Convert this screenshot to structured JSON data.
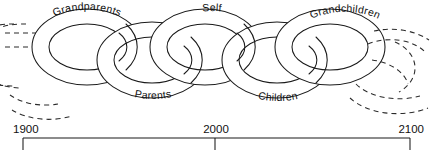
{
  "figure": {
    "type": "diagram",
    "stroke_color": "#1a1a1a",
    "background_color": "#ffffff",
    "dashed_color": "#2b2b2b"
  },
  "chain": {
    "links": [
      {
        "id": "link-past",
        "label": "",
        "label_position": "none",
        "style": "dashed",
        "note": "partial link continuing off the left edge"
      },
      {
        "id": "link-grandparents",
        "label": "Grandparents",
        "label_position": "top",
        "style": "solid"
      },
      {
        "id": "link-parents",
        "label": "Parents",
        "label_position": "bottom",
        "style": "solid"
      },
      {
        "id": "link-self",
        "label": "Self",
        "label_position": "top",
        "style": "solid"
      },
      {
        "id": "link-children",
        "label": "Children",
        "label_position": "bottom",
        "style": "solid"
      },
      {
        "id": "link-grandchildren",
        "label": "Grandchildren",
        "label_position": "top",
        "style": "solid"
      },
      {
        "id": "link-future",
        "label": "",
        "label_position": "none",
        "style": "dashed",
        "note": "partial link continuing off the right edge"
      }
    ]
  },
  "timeline": {
    "ticks": [
      {
        "label": "1900",
        "value": 1900
      },
      {
        "label": "2000",
        "value": 2000
      },
      {
        "label": "2100",
        "value": 2100
      }
    ],
    "range_start": "1900",
    "range_end": "2100"
  }
}
